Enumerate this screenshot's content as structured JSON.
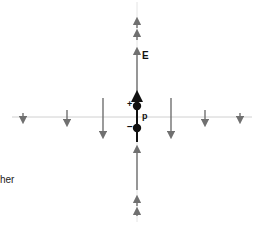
{
  "diagram": {
    "labels": {
      "field": "E",
      "dipole_moment": "p",
      "positive_charge": "+",
      "negative_charge": "−",
      "partial_text": "her"
    },
    "colors": {
      "axis": "#d0d0d0",
      "arrow": "#707070",
      "dipole": "#111111",
      "background": "#ffffff"
    },
    "axes": {
      "horizontal": {
        "y": 117,
        "x_start": 12,
        "x_end": 252
      },
      "vertical": {
        "x": 137,
        "y_start": 2,
        "y_end": 222
      }
    },
    "dipole": {
      "positive": {
        "x": 137,
        "y": 106
      },
      "negative": {
        "x": 137,
        "y": 128
      }
    },
    "perpendicular_field_arrows": [
      {
        "x": 23,
        "y1": 113,
        "y2": 123,
        "direction": "down"
      },
      {
        "x": 67,
        "y1": 110,
        "y2": 126,
        "direction": "down"
      },
      {
        "x": 103,
        "y1": 98,
        "y2": 138,
        "direction": "down"
      },
      {
        "x": 171,
        "y1": 98,
        "y2": 138,
        "direction": "down"
      },
      {
        "x": 205,
        "y1": 110,
        "y2": 126,
        "direction": "down"
      },
      {
        "x": 240,
        "y1": 113,
        "y2": 123,
        "direction": "down"
      }
    ],
    "axial_field_arrows": [
      {
        "x": 137,
        "y1": 28,
        "y2": 18,
        "direction": "up"
      },
      {
        "x": 137,
        "y1": 40,
        "y2": 30,
        "direction": "up"
      },
      {
        "x": 137,
        "y1": 92,
        "y2": 48,
        "direction": "up"
      },
      {
        "x": 137,
        "y1": 190,
        "y2": 146,
        "direction": "up"
      },
      {
        "x": 137,
        "y1": 206,
        "y2": 196,
        "direction": "up"
      },
      {
        "x": 137,
        "y1": 216,
        "y2": 208,
        "direction": "up"
      }
    ]
  }
}
